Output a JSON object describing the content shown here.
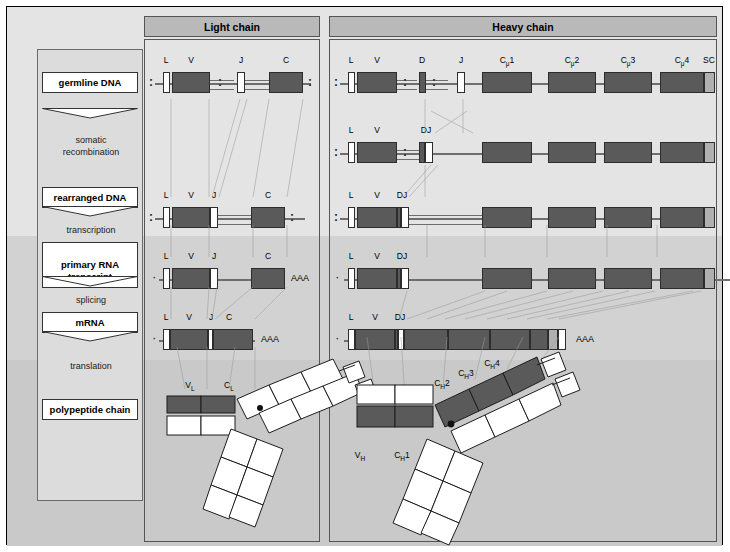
{
  "figure": {
    "colors": {
      "exon_dark": "#5a5a5a",
      "exon_light": "#b0b0b0",
      "exon_open": "#ffffff",
      "panel_header": "#b9b9b9",
      "background": "#e4e4e4",
      "band_mid": "#d2d2d2",
      "band_low": "#c9c9c9",
      "line": "#6e6e6e"
    }
  },
  "stages": {
    "boxes": [
      {
        "label": "germline  DNA"
      },
      {
        "label": "rearranged  DNA"
      },
      {
        "label": "primary RNA\ntranscript"
      },
      {
        "label": "mRNA"
      },
      {
        "label": "polypeptide chain"
      }
    ],
    "processes": [
      {
        "label": "somatic\nrecombination"
      },
      {
        "label": "transcription"
      },
      {
        "label": "splicing"
      },
      {
        "label": "translation"
      }
    ]
  },
  "panels": [
    {
      "id": "light",
      "title": "Light chain"
    },
    {
      "id": "heavy",
      "title": "Heavy chain"
    }
  ],
  "light_chain": {
    "germline": {
      "segments": [
        "L",
        "V",
        "J",
        "C"
      ]
    },
    "rearranged": {
      "segments": [
        "L",
        "V",
        "J",
        "C"
      ]
    },
    "primary_rna": {
      "segments": [
        "L",
        "V",
        "J",
        "C"
      ],
      "polya": "AAA"
    },
    "mrna": {
      "segments": [
        "L",
        "V",
        "J",
        "C"
      ],
      "polya": "AAA"
    },
    "protein": {
      "domains": [
        "V<sub>L</sub>",
        "C<sub>L</sub>"
      ],
      "domain_names": [
        "VL",
        "CL"
      ]
    }
  },
  "heavy_chain": {
    "germline": {
      "segments": [
        "L",
        "V",
        "D",
        "J",
        "Cμ1",
        "Cμ2",
        "Cμ3",
        "Cμ4",
        "SC",
        "pAμs",
        "MC",
        "pAμm"
      ]
    },
    "recombined": {
      "segments": [
        "L",
        "V",
        "DJ"
      ]
    },
    "rearranged": {
      "segments": [
        "L",
        "V",
        "DJ"
      ]
    },
    "primary_rna": {
      "segments": [
        "L",
        "V",
        "DJ"
      ],
      "polya": "AAA"
    },
    "mrna": {
      "segments": [
        "L",
        "V",
        "DJ"
      ],
      "polya": "AAA"
    },
    "protein": {
      "domains": [
        "V<sub>H</sub>",
        "C<sub>H</sub>1",
        "C<sub>H</sub>2",
        "C<sub>H</sub>3",
        "C<sub>H</sub>4"
      ],
      "domain_names": [
        "VH",
        "CH1",
        "CH2",
        "CH3",
        "CH4"
      ]
    }
  }
}
